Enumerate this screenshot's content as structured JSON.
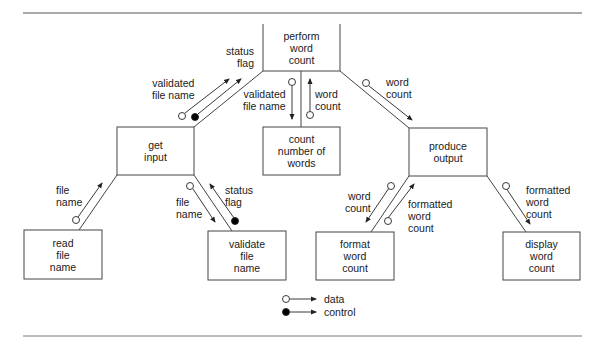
{
  "diagram": {
    "type": "structure-chart",
    "modules": {
      "perform": "perform\nword\ncount",
      "get_input": "get\ninput",
      "count_words": "count\nnumber of\nwords",
      "produce_output": "produce\noutput",
      "read_file": "read\nfile\nname",
      "validate_file": "validate\nfile\nname",
      "format_count": "format\nword\ncount",
      "display_count": "display\nword\ncount"
    },
    "couples": {
      "gi_validated": "validated\nfile name",
      "gi_status": "status\nflag",
      "cw_validated": "validated\nfile name",
      "cw_wordcount": "word\ncount",
      "po_wordcount": "word\ncount",
      "rf_filename": "file\nname",
      "vf_filename": "file\nname",
      "vf_status": "status\nflag",
      "fc_wordcount": "word\ncount",
      "fc_formatted": "formatted\nword\ncount",
      "dc_formatted": "formatted\nword\ncount"
    },
    "legend": {
      "data": "data",
      "control": "control"
    },
    "colors": {
      "line": "#333333",
      "rule": "#555555",
      "filled": "#000000"
    }
  }
}
